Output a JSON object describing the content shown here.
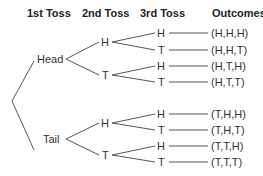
{
  "headers": [
    "1st Toss",
    "2nd Toss",
    "3rd Toss",
    "Outcomes"
  ],
  "first_toss": [
    "Head",
    "Tail"
  ],
  "second_toss": [
    "H",
    "T",
    "H",
    "T"
  ],
  "third_toss": [
    "H",
    "T",
    "H",
    "T",
    "H",
    "T",
    "H",
    "T"
  ],
  "outcomes": [
    "(H,H,H)",
    "(H,H,T)",
    "(H,T,H)",
    "(H,T,T)",
    "(T,H,H)",
    "(T,H,T)",
    "(T,T,H)",
    "(T,T,T)"
  ],
  "line_color": "#555555"
}
